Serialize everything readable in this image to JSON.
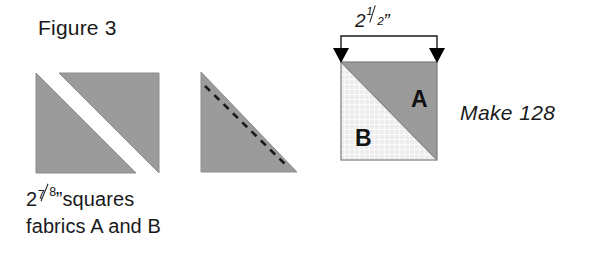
{
  "figure": {
    "title": "Figure 3",
    "caption_line1_prefix": "2",
    "caption_line1_numerator": "7",
    "caption_line1_denominator": "8",
    "caption_line1_suffix": "”squares",
    "caption_line2": "fabrics A and B",
    "make_label": "Make 128",
    "dimension_prefix": "2",
    "dimension_numerator": "1",
    "dimension_denominator": "2",
    "dimension_suffix": "”"
  },
  "block": {
    "patch_a_label": "A",
    "patch_b_label": "B"
  },
  "colors": {
    "fabric_gray": "#9b9b9b",
    "fabric_gray_edge": "#8a8a8a",
    "fabric_light": "#ededed",
    "fabric_light_grid": "#ffffff",
    "outline": "#6f6f6f",
    "stitch_line": "#1a1a1a",
    "arrow": "#000000",
    "background": "#ffffff",
    "text": "#1a1a1a"
  },
  "steps": [
    {
      "name": "cut-square",
      "description": "Square of fabric cut in half on the diagonal into two triangles"
    },
    {
      "name": "stitch-triangle",
      "description": "Single triangle with dashed stitching line along the bias edge"
    },
    {
      "name": "finished-block",
      "description": "Finished half-square-triangle unit with patch A and patch B"
    }
  ]
}
